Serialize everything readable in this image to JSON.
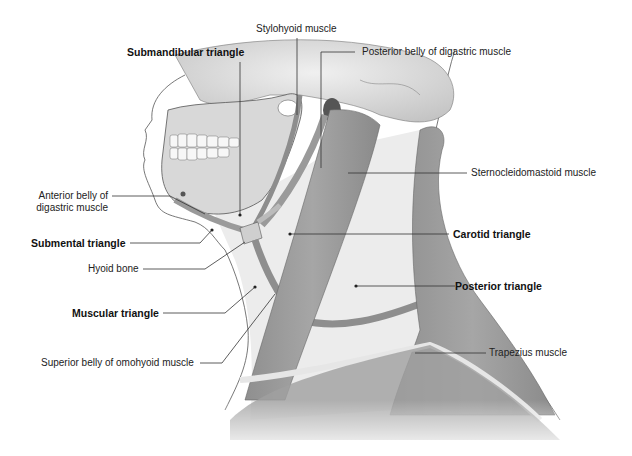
{
  "figure": {
    "colors": {
      "background": "#ffffff",
      "muscle": "#9a9a9a",
      "muscle_dark": "#7c7c7c",
      "bone": "#d6d6d6",
      "triangle_fill": "#ececec",
      "leader_line": "#333333",
      "text": "#222222"
    }
  },
  "labels": {
    "stylohyoid": "Stylohyoid muscle",
    "submandibular": "Submandibular triangle",
    "posterior_digastric": "Posterior belly of digastric muscle",
    "scm": "Sternocleidomastoid muscle",
    "anterior_digastric_line1": "Anterior belly of",
    "anterior_digastric_line2": "digastric muscle",
    "submental": "Submental triangle",
    "carotid": "Carotid triangle",
    "hyoid": "Hyoid bone",
    "posterior_triangle": "Posterior triangle",
    "muscular": "Muscular triangle",
    "omohyoid": "Superior belly of omohyoid muscle",
    "trapezius": "Trapezius muscle"
  }
}
